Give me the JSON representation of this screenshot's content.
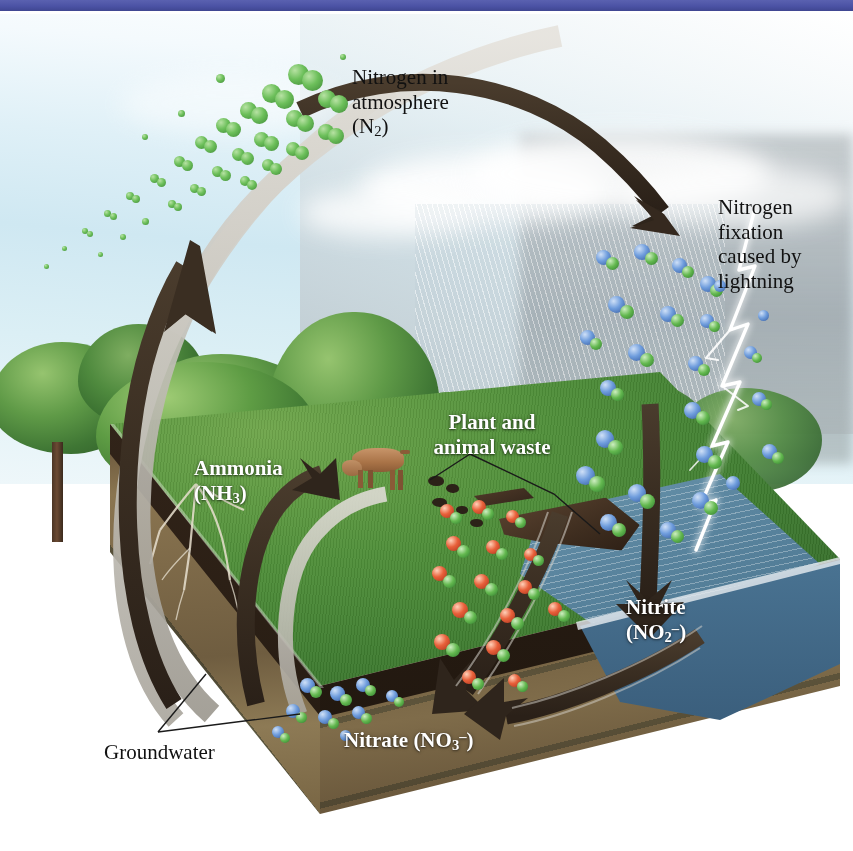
{
  "page": {
    "accent_bar_color": "#4c53a5",
    "background_color": "#ffffff"
  },
  "diagram": {
    "type": "illustrated-cycle",
    "labels": [
      {
        "id": "nitrogen-in-atmosphere",
        "line1": "Nitrogen in",
        "line2": "atmosphere",
        "line3_pre": "(N",
        "line3_sub": "2",
        "line3_post": ")",
        "style": "dark-serif",
        "color": "#111111"
      },
      {
        "id": "nitrogen-fixation-lightning",
        "line1": "Nitrogen",
        "line2": "fixation",
        "line3": "caused by",
        "line4": "lightning",
        "style": "dark-serif",
        "color": "#111111"
      },
      {
        "id": "ammonia",
        "line1": "Ammonia",
        "line2_pre": "(NH",
        "line2_sub": "3",
        "line2_post": ")",
        "style": "white-bold-serif",
        "color": "#ffffff"
      },
      {
        "id": "plant-and-animal-waste",
        "line1": "Plant and",
        "line2": "animal waste",
        "style": "white-bold-serif",
        "color": "#ffffff"
      },
      {
        "id": "nitrite",
        "line1": "Nitrite",
        "line2_pre": "(NO",
        "line2_sub": "2",
        "line2_sup": "–",
        "line2_post": ")",
        "style": "white-bold-serif",
        "color": "#ffffff"
      },
      {
        "id": "nitrate",
        "line1_pre": "Nitrate (NO",
        "line1_sub": "3",
        "line1_sup": "–",
        "line1_post": ")",
        "style": "white-bold-serif",
        "color": "#ffffff"
      },
      {
        "id": "groundwater",
        "line1": "Groundwater",
        "style": "dark-serif",
        "color": "#111111"
      }
    ],
    "molecule_groups": [
      {
        "id": "n2-atmospheric",
        "name": "N2 molecules",
        "colors": [
          "#6cbf5a"
        ],
        "count": 46
      },
      {
        "id": "nitrogen-oxides-lightning",
        "name": "nitrogen oxide molecules",
        "colors": [
          "#6f9ddd",
          "#63b84f"
        ],
        "count": 34
      },
      {
        "id": "ammonium-waste",
        "name": "waste-derived molecules",
        "colors": [
          "#e8603a",
          "#63b84f"
        ],
        "count": 30
      },
      {
        "id": "nitrate-soil",
        "name": "nitrate molecules in soil",
        "colors": [
          "#6f9ddd",
          "#63b84f"
        ],
        "count": 16
      }
    ],
    "scene_elements": [
      {
        "id": "sky",
        "name": "sky"
      },
      {
        "id": "rain",
        "name": "rainfall"
      },
      {
        "id": "lightning-bolt",
        "name": "lightning bolt"
      },
      {
        "id": "forest",
        "name": "tree line"
      },
      {
        "id": "grass-field",
        "name": "grass field"
      },
      {
        "id": "soil-block",
        "name": "soil cross-section block"
      },
      {
        "id": "groundwater-layers",
        "name": "groundwater layers"
      },
      {
        "id": "pond",
        "name": "pond"
      },
      {
        "id": "cow",
        "name": "grazing cow"
      },
      {
        "id": "fallen-log",
        "name": "fallen log"
      },
      {
        "id": "tree-roots",
        "name": "tree roots"
      }
    ],
    "arrows": [
      {
        "id": "arrow-soil-to-atmosphere-dark",
        "from": "soil",
        "to": "atmosphere",
        "style": "dark"
      },
      {
        "id": "arrow-soil-to-atmosphere-light",
        "from": "soil",
        "to": "atmosphere",
        "style": "light"
      },
      {
        "id": "arrow-atmosphere-to-ground",
        "from": "atmosphere",
        "to": "ground-right",
        "style": "dark"
      },
      {
        "id": "arrow-lightning-to-ground",
        "from": "lightning-fixation",
        "to": "ground",
        "style": "dark"
      },
      {
        "id": "arrow-ammonia-up",
        "from": "soil",
        "to": "ammonia",
        "style": "dark"
      },
      {
        "id": "arrow-waste-to-nitrate",
        "from": "plant-animal-waste",
        "to": "nitrate",
        "style": "dark"
      },
      {
        "id": "arrow-nitrite-to-nitrate",
        "from": "nitrite",
        "to": "nitrate",
        "style": "dark"
      },
      {
        "id": "arrow-groundwater-loop",
        "from": "groundwater",
        "to": "ammonia",
        "style": "light"
      }
    ]
  }
}
